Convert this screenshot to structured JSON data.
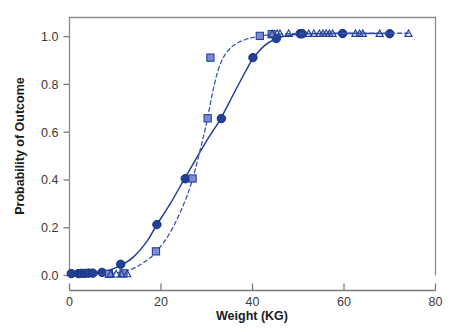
{
  "chart_data": {
    "type": "line",
    "title": "",
    "xlabel": "Weight (KG)",
    "ylabel": "Probability of Outcome",
    "xlim": [
      0,
      80
    ],
    "ylim": [
      0.0,
      1.08
    ],
    "xticks": [
      "0",
      "20",
      "40",
      "60",
      "80"
    ],
    "xtick_values": [
      0,
      20,
      40,
      60,
      80
    ],
    "yticks": [
      "0.0",
      "0.2",
      "0.4",
      "0.6",
      "0.8",
      "1.0"
    ],
    "ytick_values": [
      0.0,
      0.2,
      0.4,
      0.6,
      0.8,
      1.0
    ],
    "grid": false,
    "legend": "none",
    "colors": {
      "series_1_line": "#21409A",
      "series_1_marker_fill": "#21409A",
      "series_1_marker_edge": "#16307A",
      "series_2_line": "#3C55B0",
      "series_2_marker_fill": "#7C8BD0",
      "series_2_marker_edge": "#21409A",
      "open_marker_edge": "#21409A",
      "axis": "#7A7A7A",
      "text": "#2E2E2E",
      "background": "#FFFFFF"
    },
    "series": [
      {
        "name": "Series 1 (solid, filled circles)",
        "style": "solid",
        "marker": "filled-circle",
        "points": [
          {
            "x": 0.4,
            "y": 0.008
          },
          {
            "x": 1.9,
            "y": 0.008
          },
          {
            "x": 2.6,
            "y": 0.009
          },
          {
            "x": 3.4,
            "y": 0.009
          },
          {
            "x": 4.2,
            "y": 0.01
          },
          {
            "x": 5.1,
            "y": 0.01
          },
          {
            "x": 7.1,
            "y": 0.013
          },
          {
            "x": 11.2,
            "y": 0.047
          },
          {
            "x": 19.1,
            "y": 0.213
          },
          {
            "x": 25.3,
            "y": 0.405
          },
          {
            "x": 33.2,
            "y": 0.657
          },
          {
            "x": 40.1,
            "y": 0.912
          },
          {
            "x": 45.2,
            "y": 0.992
          },
          {
            "x": 50.4,
            "y": 1.012
          },
          {
            "x": 50.9,
            "y": 1.012
          },
          {
            "x": 59.7,
            "y": 1.013
          },
          {
            "x": 70.0,
            "y": 1.012
          }
        ],
        "curve": [
          {
            "x": 0.0,
            "y": 0.006
          },
          {
            "x": 4.0,
            "y": 0.009
          },
          {
            "x": 8.0,
            "y": 0.018
          },
          {
            "x": 11.0,
            "y": 0.04
          },
          {
            "x": 14.0,
            "y": 0.078
          },
          {
            "x": 17.0,
            "y": 0.145
          },
          {
            "x": 19.0,
            "y": 0.21
          },
          {
            "x": 22.0,
            "y": 0.3
          },
          {
            "x": 25.0,
            "y": 0.4
          },
          {
            "x": 28.0,
            "y": 0.5
          },
          {
            "x": 30.5,
            "y": 0.58
          },
          {
            "x": 33.0,
            "y": 0.655
          },
          {
            "x": 36.0,
            "y": 0.765
          },
          {
            "x": 38.5,
            "y": 0.855
          },
          {
            "x": 40.0,
            "y": 0.905
          },
          {
            "x": 42.5,
            "y": 0.96
          },
          {
            "x": 45.0,
            "y": 0.99
          },
          {
            "x": 48.0,
            "y": 1.006
          },
          {
            "x": 52.0,
            "y": 1.012
          },
          {
            "x": 60.0,
            "y": 1.013
          },
          {
            "x": 70.0,
            "y": 1.013
          }
        ]
      },
      {
        "name": "Series 2 (dashed, open squares)",
        "style": "dashed",
        "marker": "open-square",
        "points": [
          {
            "x": 8.6,
            "y": 0.007
          },
          {
            "x": 11.8,
            "y": 0.009
          },
          {
            "x": 18.9,
            "y": 0.101
          },
          {
            "x": 26.9,
            "y": 0.406
          },
          {
            "x": 30.2,
            "y": 0.658
          },
          {
            "x": 30.8,
            "y": 0.912
          },
          {
            "x": 41.6,
            "y": 1.003
          },
          {
            "x": 44.2,
            "y": 1.01
          }
        ],
        "curve": [
          {
            "x": 6.0,
            "y": 0.004
          },
          {
            "x": 10.0,
            "y": 0.01
          },
          {
            "x": 14.0,
            "y": 0.03
          },
          {
            "x": 17.0,
            "y": 0.065
          },
          {
            "x": 19.0,
            "y": 0.1
          },
          {
            "x": 22.0,
            "y": 0.18
          },
          {
            "x": 25.0,
            "y": 0.3
          },
          {
            "x": 27.0,
            "y": 0.41
          },
          {
            "x": 29.0,
            "y": 0.56
          },
          {
            "x": 30.2,
            "y": 0.66
          },
          {
            "x": 31.2,
            "y": 0.76
          },
          {
            "x": 32.5,
            "y": 0.86
          },
          {
            "x": 34.0,
            "y": 0.925
          },
          {
            "x": 36.0,
            "y": 0.965
          },
          {
            "x": 38.5,
            "y": 0.988
          },
          {
            "x": 41.5,
            "y": 1.002
          },
          {
            "x": 45.0,
            "y": 1.01
          },
          {
            "x": 50.0,
            "y": 1.013
          },
          {
            "x": 56.0,
            "y": 1.014
          },
          {
            "x": 62.0,
            "y": 1.014
          },
          {
            "x": 70.0,
            "y": 1.014
          },
          {
            "x": 74.5,
            "y": 1.014
          }
        ]
      },
      {
        "name": "Series 3 (open triangles)",
        "style": "markers-only",
        "marker": "open-triangle",
        "points": [
          {
            "x": 9.0,
            "y": 0.006
          },
          {
            "x": 10.2,
            "y": 0.006
          },
          {
            "x": 11.4,
            "y": 0.006
          },
          {
            "x": 12.6,
            "y": 0.007
          },
          {
            "x": 44.3,
            "y": 1.011
          },
          {
            "x": 45.4,
            "y": 1.013
          },
          {
            "x": 46.0,
            "y": 1.013
          },
          {
            "x": 47.9,
            "y": 1.013
          },
          {
            "x": 52.3,
            "y": 1.013
          },
          {
            "x": 53.4,
            "y": 1.013
          },
          {
            "x": 54.6,
            "y": 1.013
          },
          {
            "x": 55.4,
            "y": 1.013
          },
          {
            "x": 56.1,
            "y": 1.013
          },
          {
            "x": 56.8,
            "y": 1.013
          },
          {
            "x": 57.5,
            "y": 1.013
          },
          {
            "x": 62.5,
            "y": 1.013
          },
          {
            "x": 63.4,
            "y": 1.013
          },
          {
            "x": 64.1,
            "y": 1.013
          },
          {
            "x": 67.8,
            "y": 1.013
          },
          {
            "x": 74.1,
            "y": 1.013
          }
        ]
      }
    ]
  }
}
